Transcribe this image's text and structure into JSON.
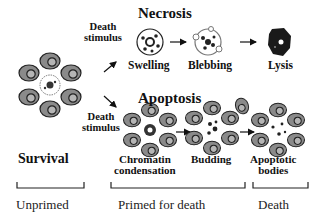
{
  "diagram": {
    "stimulus_label": "Death stimulus",
    "stimulus_line1": "Death",
    "stimulus_line2": "stimulus",
    "start_state": "Survival",
    "pathways": [
      {
        "name": "Necrosis",
        "steps": [
          "Swelling",
          "Blebbing",
          "Lysis"
        ]
      },
      {
        "name": "Apoptosis",
        "steps": [
          "Chromatin condensation",
          "Budding",
          "Apoptotic bodies"
        ],
        "step_lines": [
          [
            "Chromatin",
            "condensation"
          ],
          [
            "Budding"
          ],
          [
            "Apoptotic",
            "bodies"
          ]
        ]
      }
    ],
    "phases": [
      "Unprimed",
      "Primed for death",
      "Death"
    ],
    "colors": {
      "cell_fill": "#8a8a8a",
      "outline": "#222222",
      "background": "#ffffff"
    }
  }
}
